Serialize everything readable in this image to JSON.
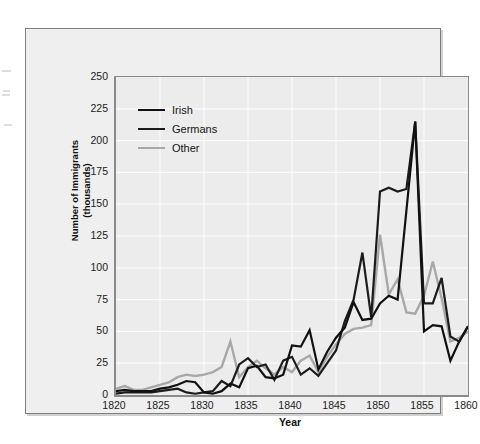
{
  "chart_data": {
    "type": "line",
    "title": "",
    "subtitle": "",
    "xlabel": "Year",
    "ylabel": "Number of Immigrants (thousands)",
    "ylabel_line1": "Number of Immigrants",
    "ylabel_line2": "(thousands)",
    "xlim": [
      1820,
      1860
    ],
    "ylim": [
      0,
      250
    ],
    "xticks": [
      1820,
      1825,
      1830,
      1835,
      1840,
      1845,
      1850,
      1855,
      1860
    ],
    "xtick_labels": [
      "1820",
      "1825",
      "1830",
      "1835",
      "1840",
      "1845",
      "1850",
      "1855",
      "1860"
    ],
    "yticks": [
      0,
      25,
      50,
      75,
      100,
      125,
      150,
      175,
      200,
      225,
      250
    ],
    "ytick_labels": [
      "0",
      "25",
      "50",
      "75",
      "100",
      "125",
      "150",
      "175",
      "200",
      "225",
      "250"
    ],
    "grid": true,
    "grid_color": "#ffffff",
    "plot_background": "#ececec",
    "figure_background": "#efefef",
    "legend_position": "upper left",
    "x": [
      1820,
      1821,
      1822,
      1823,
      1824,
      1825,
      1826,
      1827,
      1828,
      1829,
      1830,
      1831,
      1832,
      1833,
      1834,
      1835,
      1836,
      1837,
      1838,
      1839,
      1840,
      1841,
      1842,
      1843,
      1844,
      1845,
      1846,
      1847,
      1848,
      1849,
      1850,
      1851,
      1852,
      1853,
      1854,
      1855,
      1856,
      1857,
      1858,
      1859,
      1860
    ],
    "series": [
      {
        "name": "Irish",
        "color": "#111111",
        "width": 2.2,
        "values": [
          3,
          4,
          3,
          3,
          3,
          5,
          6,
          8,
          11,
          10,
          2,
          1,
          3,
          9,
          6,
          21,
          23,
          14,
          13,
          16,
          39,
          38,
          51,
          20,
          34,
          45,
          53,
          73,
          59,
          60,
          72,
          78,
          75,
          145,
          215,
          50,
          55,
          54,
          27,
          42,
          54
        ]
      },
      {
        "name": "Germans",
        "color": "#1c1c1c",
        "width": 2.2,
        "values": [
          1,
          2,
          2,
          2,
          2,
          3,
          4,
          5,
          2,
          1,
          2,
          3,
          11,
          7,
          24,
          29,
          22,
          24,
          12,
          27,
          30,
          16,
          21,
          15,
          25,
          35,
          58,
          75,
          112,
          61,
          160,
          163,
          160,
          162,
          215,
          72,
          72,
          92,
          46,
          42,
          54
        ]
      },
      {
        "name": "Other",
        "color": "#a8a8a8",
        "width": 2.4,
        "values": [
          5,
          7,
          4,
          4,
          6,
          8,
          10,
          14,
          16,
          15,
          16,
          18,
          22,
          42,
          14,
          22,
          27,
          21,
          16,
          22,
          18,
          27,
          31,
          18,
          30,
          40,
          48,
          52,
          53,
          55,
          126,
          79,
          91,
          65,
          64,
          78,
          105,
          76,
          42,
          45,
          50
        ]
      }
    ]
  },
  "legend": {
    "items": [
      {
        "label": "Irish",
        "color": "#111111"
      },
      {
        "label": "Germans",
        "color": "#1c1c1c"
      },
      {
        "label": "Other",
        "color": "#a8a8a8"
      }
    ]
  },
  "axes": {
    "x_title": "Year",
    "y_title_line1": "Number of Immigrants",
    "y_title_line2": "(thousands)"
  }
}
